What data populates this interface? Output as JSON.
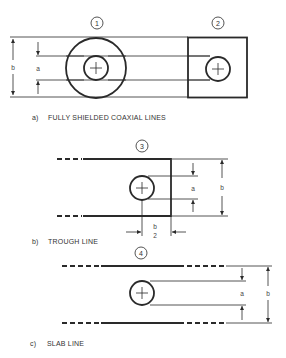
{
  "figure": {
    "panel_a": {
      "caption_letter": "a)",
      "caption_text": "FULLY SHIELDED COAXIAL LINES",
      "items": [
        {
          "number": "1",
          "shape": "circular-coax"
        },
        {
          "number": "2",
          "shape": "square-coax"
        }
      ],
      "dim_outer": "b",
      "dim_inner": "a"
    },
    "panel_b": {
      "caption_letter": "b)",
      "caption_text": "TROUGH LINE",
      "number": "3",
      "dim_inner": "a",
      "dim_outer": "b",
      "dim_half_num": "b",
      "dim_half_den": "2"
    },
    "panel_c": {
      "caption_letter": "c)",
      "caption_text": "SLAB LINE",
      "number": "4",
      "dim_inner": "a",
      "dim_outer": "b"
    },
    "colors": {
      "line": "#2a2a2a",
      "background": "#ffffff"
    }
  }
}
